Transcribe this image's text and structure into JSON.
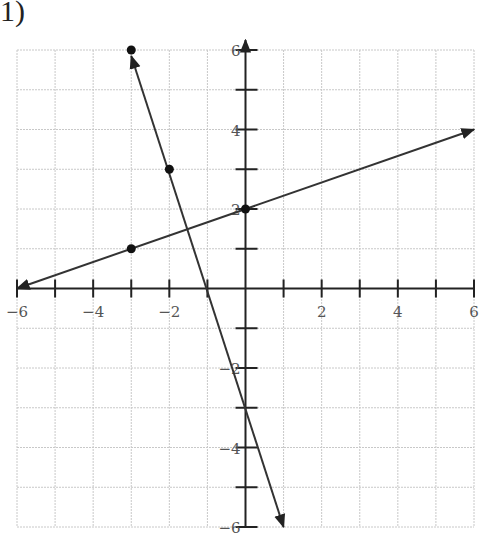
{
  "problem": {
    "label": "1)"
  },
  "chart_data": {
    "type": "line",
    "title": "",
    "xlabel": "",
    "ylabel": "",
    "xlim": [
      -6,
      6
    ],
    "ylim": [
      -6,
      6
    ],
    "grid": true,
    "x_ticks": [
      -6,
      -5,
      -4,
      -3,
      -2,
      -1,
      0,
      1,
      2,
      3,
      4,
      5,
      6
    ],
    "y_ticks": [
      -6,
      -5,
      -4,
      -3,
      -2,
      -1,
      0,
      1,
      2,
      3,
      4,
      5,
      6
    ],
    "x_tick_labels": [
      "−6",
      "−4",
      "−2",
      "2",
      "4",
      "6"
    ],
    "y_tick_labels": [
      "6",
      "4",
      "2",
      "−2",
      "−4",
      "−6"
    ],
    "series": [
      {
        "name": "line-1",
        "equation": "y = -3x - 3",
        "points": [
          [
            -3,
            6
          ],
          [
            -2,
            3
          ]
        ],
        "start": [
          -3,
          6
        ],
        "end_arrow": [
          1,
          -6
        ],
        "start_arrow": true
      },
      {
        "name": "line-2",
        "equation": "y = x/3 + 2",
        "points": [
          [
            -3,
            1
          ],
          [
            0,
            2
          ]
        ],
        "start_arrow": [
          -6,
          0
        ],
        "end_arrow": [
          6,
          4
        ]
      }
    ],
    "intersection": [
      -1.5,
      1.5
    ]
  }
}
